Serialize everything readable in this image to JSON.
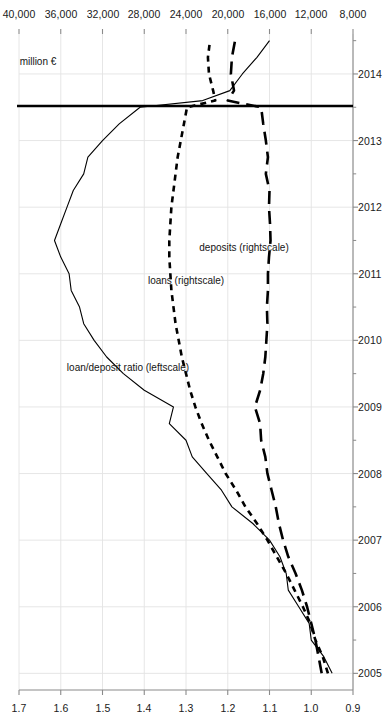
{
  "figure": {
    "orientation": "rotated-90",
    "background": "#ffffff",
    "ink": "#000000",
    "grid_color": "#e3e3e3",
    "axis_color": "#8a8a8a"
  },
  "chart_data": {
    "type": "line",
    "title": "",
    "subtitle": "",
    "xlabel": "",
    "ylabel": "",
    "y2label": "million €",
    "grid": true,
    "legend": "inline-annotations",
    "x": [
      2005.0,
      2005.25,
      2005.5,
      2005.75,
      2006.0,
      2006.25,
      2006.5,
      2006.75,
      2007.0,
      2007.25,
      2007.5,
      2007.75,
      2008.0,
      2008.25,
      2008.5,
      2008.75,
      2009.0,
      2009.25,
      2009.5,
      2009.75,
      2010.0,
      2010.25,
      2010.5,
      2010.75,
      2011.0,
      2011.25,
      2011.5,
      2011.75,
      2012.0,
      2012.25,
      2012.5,
      2012.75,
      2013.0,
      2013.25,
      2013.5,
      2013.6,
      2013.75,
      2014.0,
      2014.25,
      2014.5
    ],
    "xlim": [
      2004.75,
      2014.6
    ],
    "xticks": [
      2005,
      2006,
      2007,
      2008,
      2009,
      2010,
      2011,
      2012,
      2013,
      2014
    ],
    "xticklabels": [
      "2005",
      "2006",
      "2007",
      "2008",
      "2009",
      "2010",
      "2011",
      "2012",
      "2013",
      "2014"
    ],
    "ylim": [
      0.9,
      1.7
    ],
    "yticks": [
      0.9,
      1.0,
      1.1,
      1.2,
      1.3,
      1.4,
      1.5,
      1.6,
      1.7
    ],
    "yticklabels": [
      "0.9",
      "1.0",
      "1.1",
      "1.2",
      "1.3",
      "1.4",
      "1.5",
      "1.6",
      "1.7"
    ],
    "y2lim": [
      8000,
      40000
    ],
    "y2ticks": [
      8000,
      12000,
      16000,
      20000,
      24000,
      28000,
      32000,
      36000,
      40000
    ],
    "y2ticklabels": [
      "8,000",
      "12,000",
      "16,000",
      "20,000",
      "24,000",
      "28,000",
      "32,000",
      "36,000",
      "40,000"
    ],
    "annotations": [
      {
        "text": "loan/deposit ratio (leftscale)",
        "at_x": 2009.6,
        "at_y": 1.44,
        "axis": "left"
      },
      {
        "text": "loans (rightscale)",
        "at_x": 2010.9,
        "at_y": 1.3,
        "axis": "left"
      },
      {
        "text": "deposits (rightscale)",
        "at_x": 2011.4,
        "at_y": 1.16,
        "axis": "left"
      },
      {
        "text": "million €",
        "at_x": 2014.2,
        "at_y": 1.655,
        "axis": "left"
      }
    ],
    "reference_line": {
      "x": 2013.52,
      "style": "solid",
      "width": 2.6,
      "color": "#000000"
    },
    "series": [
      {
        "name": "loan/deposit ratio (leftscale)",
        "axis": "left",
        "style": "solid",
        "linewidth": 1.1,
        "color": "#000000",
        "values": [
          0.95,
          0.97,
          1.0,
          1.005,
          1.03,
          1.055,
          1.06,
          1.075,
          1.1,
          1.14,
          1.19,
          1.215,
          1.25,
          1.285,
          1.3,
          1.34,
          1.33,
          1.4,
          1.45,
          1.49,
          1.52,
          1.545,
          1.555,
          1.575,
          1.58,
          1.6,
          1.615,
          1.6,
          1.585,
          1.57,
          1.545,
          1.535,
          1.5,
          1.46,
          1.41,
          1.26,
          1.195,
          1.165,
          1.13,
          1.1
        ]
      },
      {
        "name": "loans (rightscale)",
        "axis": "right",
        "style": "dashed-short",
        "linewidth": 2.6,
        "color": "#000000",
        "values": [
          10400,
          10900,
          11600,
          12100,
          12800,
          13600,
          14400,
          15300,
          16200,
          17200,
          18300,
          19200,
          20200,
          21000,
          21800,
          22500,
          23100,
          23600,
          24000,
          24400,
          24700,
          25000,
          25200,
          25400,
          25500,
          25600,
          25600,
          25500,
          25400,
          25200,
          25000,
          24800,
          24500,
          24200,
          23900,
          21200,
          21400,
          21800,
          21900,
          21700
        ]
      },
      {
        "name": "deposits (rightscale)",
        "axis": "right",
        "style": "dashed-long",
        "linewidth": 2.6,
        "color": "#000000",
        "values": [
          11000,
          11300,
          11600,
          12000,
          12400,
          12900,
          13500,
          14200,
          14700,
          15100,
          15400,
          15800,
          16200,
          16400,
          16800,
          16900,
          17400,
          16900,
          16600,
          16400,
          16300,
          16200,
          16250,
          16150,
          16150,
          16050,
          15900,
          15950,
          16050,
          16000,
          16350,
          16150,
          16350,
          16600,
          16800,
          20000,
          19400,
          19700,
          19600,
          19300
        ]
      }
    ]
  }
}
